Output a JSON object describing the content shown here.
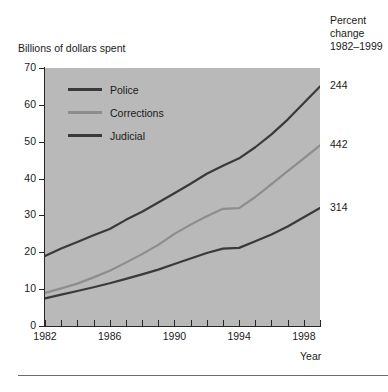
{
  "figure": {
    "y_axis_title": "Billions of dollars spent",
    "x_axis_title": "Year",
    "percent_header_line1": "Percent",
    "percent_header_line2": "change",
    "percent_header_line3": "1982–1999"
  },
  "colors": {
    "plot_background": "#b9b9b9",
    "police": "#3a3a3a",
    "corrections": "#8d8d8d",
    "judicial": "#3a3a3a",
    "axis": "#262626",
    "text": "#1a1a1a",
    "rule": "#6b6b6b"
  },
  "chart_data": {
    "type": "line",
    "title": "",
    "xlabel": "Year",
    "ylabel": "Billions of dollars spent",
    "xlim": [
      1982,
      1999
    ],
    "ylim": [
      0,
      70
    ],
    "grid": false,
    "legend_position": "inside-top-left",
    "ytick_labels": [
      "70",
      "60",
      "50",
      "40",
      "30",
      "20",
      "10",
      "0"
    ],
    "ytick_values": [
      70,
      60,
      50,
      40,
      30,
      20,
      10,
      0
    ],
    "xtick_values": [
      1982,
      1983,
      1984,
      1985,
      1986,
      1987,
      1988,
      1989,
      1990,
      1991,
      1992,
      1993,
      1994,
      1995,
      1996,
      1997,
      1998,
      1999
    ],
    "xtick_labels_shown": [
      "1982",
      "1986",
      "1990",
      "1994",
      "1998"
    ],
    "xtick_labeled_values": [
      1982,
      1986,
      1990,
      1994,
      1998
    ],
    "x": [
      1982,
      1983,
      1984,
      1985,
      1986,
      1987,
      1988,
      1989,
      1990,
      1991,
      1992,
      1993,
      1994,
      1995,
      1996,
      1997,
      1998,
      1999
    ],
    "series": [
      {
        "name": "Police",
        "color": "#3a3a3a",
        "percent_change": "244",
        "values": [
          19.0,
          21.0,
          22.8,
          24.6,
          26.3,
          28.8,
          31.0,
          33.5,
          36.0,
          38.6,
          41.3,
          43.5,
          45.5,
          48.5,
          52.0,
          56.0,
          60.5,
          65.0
        ]
      },
      {
        "name": "Corrections",
        "color": "#8d8d8d",
        "percent_change": "442",
        "values": [
          9.0,
          10.2,
          11.5,
          13.2,
          15.0,
          17.2,
          19.5,
          22.0,
          25.0,
          27.5,
          29.8,
          31.8,
          32.0,
          35.0,
          38.5,
          42.0,
          45.5,
          49.0
        ]
      },
      {
        "name": "Judicial",
        "color": "#3a3a3a",
        "percent_change": "314",
        "values": [
          7.5,
          8.5,
          9.5,
          10.5,
          11.6,
          12.8,
          14.0,
          15.3,
          16.8,
          18.3,
          19.8,
          21.0,
          21.2,
          23.0,
          24.8,
          27.0,
          29.5,
          32.0
        ]
      }
    ]
  }
}
